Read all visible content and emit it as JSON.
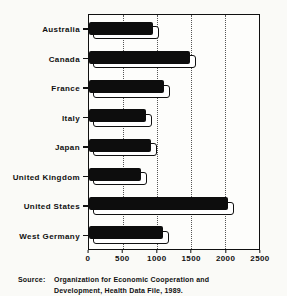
{
  "page": {
    "background": "#fafaf7",
    "ink": "#101010"
  },
  "chart_data": {
    "type": "bar",
    "orientation": "horizontal",
    "title": "",
    "xlabel": "",
    "ylabel": "",
    "categories": [
      "Australia",
      "Canada",
      "France",
      "Italy",
      "Japan",
      "United Kingdom",
      "United States",
      "West Germany"
    ],
    "values": [
      939,
      1483,
      1105,
      841,
      915,
      758,
      2051,
      1093
    ],
    "xlim": [
      0,
      2500
    ],
    "xticks": [
      0,
      500,
      1000,
      1500,
      2000,
      2500
    ],
    "grid": "vertical-dotted-every-500",
    "legend": "none",
    "bar_color": "#0d0d0d",
    "bar_shadow_color": "#ffffff"
  },
  "source": {
    "label": "Source:",
    "line1": "Organization for Economic Cooperation and",
    "line2": "Development, Health Data File, 1989."
  }
}
